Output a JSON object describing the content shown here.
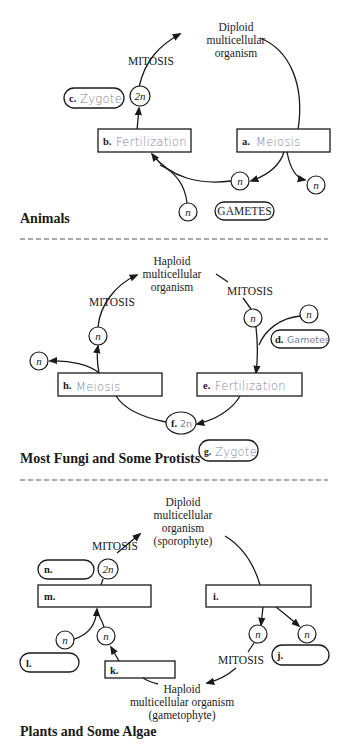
{
  "sections": [
    {
      "title": "Animals",
      "organism_label": [
        "Diploid",
        "multicellular",
        "organism"
      ],
      "mitosis": "MITOSIS",
      "ploidy_2n": "2n",
      "ploidy_n": "n",
      "gametes_label": "GAMETES",
      "answers": {
        "a": {
          "letter": "a.",
          "text": "Meiosis"
        },
        "b": {
          "letter": "b.",
          "text": "Fertilization"
        },
        "c": {
          "letter": "c.",
          "text": "Zygote"
        }
      }
    },
    {
      "title": "Most Fungi and Some Protists",
      "organism_label": [
        "Haploid",
        "multicellular",
        "organism"
      ],
      "mitosis": "MITOSIS",
      "ploidy_n": "n",
      "answers": {
        "d": {
          "letter": "d.",
          "text": "Gametes"
        },
        "e": {
          "letter": "e.",
          "text": "Fertilization"
        },
        "f": {
          "letter": "f.",
          "text": "2n"
        },
        "g": {
          "letter": "g.",
          "text": "Zygote"
        },
        "h": {
          "letter": "h.",
          "text": "Meiosis"
        }
      }
    },
    {
      "title": "Plants and Some Algae",
      "sporophyte_label": [
        "Diploid",
        "multicellular",
        "organism",
        "(sporophyte)"
      ],
      "gametophyte_label": [
        "Haploid",
        "multicellular organism",
        "(gametophyte)"
      ],
      "mitosis": "MITOSIS",
      "ploidy_2n": "2n",
      "ploidy_n": "n",
      "answers": {
        "i": {
          "letter": "i.",
          "text": ""
        },
        "j": {
          "letter": "j.",
          "text": ""
        },
        "k": {
          "letter": "k.",
          "text": ""
        },
        "l": {
          "letter": "l.",
          "text": ""
        },
        "m": {
          "letter": "m.",
          "text": ""
        },
        "n": {
          "letter": "n.",
          "text": ""
        }
      }
    }
  ]
}
